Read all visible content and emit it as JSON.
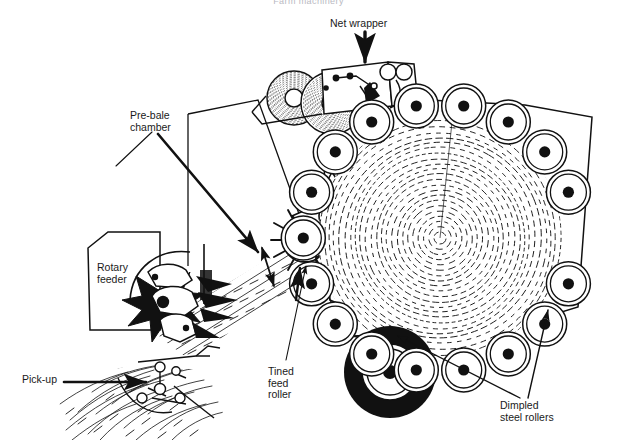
{
  "page": {
    "title_faint": "Farm machinery",
    "background": "#ffffff",
    "ink": "#1a1a1a",
    "width": 617,
    "height": 448
  },
  "labels": {
    "net_wrapper": "Net wrapper",
    "pre_bale_chamber": "Pre-bale\nchamber",
    "rotary_feeder": "Rotary\nfeeder",
    "pick_up": "Pick-up",
    "tined_feed_roller": "Tined\nfeed\nroller",
    "dimpled_steel_rollers": "Dimpled\nsteel rollers"
  },
  "diagram": {
    "type": "technical-cutaway",
    "components": [
      {
        "name": "net-wrapper-assembly",
        "desc": "net roll dispenser box with rollers and guide arms"
      },
      {
        "name": "net-roll-left",
        "desc": "spiral-wound net roll"
      },
      {
        "name": "net-roll-right",
        "desc": "spiral-wound net roll"
      },
      {
        "name": "pre-bale-chamber",
        "desc": "wedge region before bale chamber"
      },
      {
        "name": "rotary-feeder",
        "desc": "star-tined rotor feeding crop"
      },
      {
        "name": "tined-feed-roller",
        "desc": "spiked roller with radial tines"
      },
      {
        "name": "starburst-roller",
        "desc": "toothed star roller above feed roller"
      },
      {
        "name": "pick-up",
        "desc": "crop pick-up reel at ground level"
      },
      {
        "name": "bale",
        "desc": "spiral-textured round bale forming in chamber"
      },
      {
        "name": "drive-tyre",
        "desc": "large black wheel at lower-left of chamber"
      },
      {
        "name": "crop-windrow",
        "desc": "hay windrow on ground"
      }
    ],
    "roller_ring": {
      "count": 18,
      "style": "double concentric circle with solid black hub",
      "label_ref": "dimpled_steel_rollers"
    },
    "arrows": [
      {
        "from": "net_wrapper",
        "dir": "down"
      },
      {
        "from": "pre_bale_chamber",
        "dir": "down-right"
      },
      {
        "from": "pick_up",
        "dir": "right"
      },
      {
        "from": "tined_feed_roller",
        "dir": "up-right"
      },
      {
        "from": "dimpled_steel_rollers",
        "dir": "up-left"
      },
      {
        "from": "dimpled_steel_rollers",
        "dir": "up-right"
      },
      {
        "name": "oscillation",
        "dir": "double-headed"
      }
    ]
  }
}
